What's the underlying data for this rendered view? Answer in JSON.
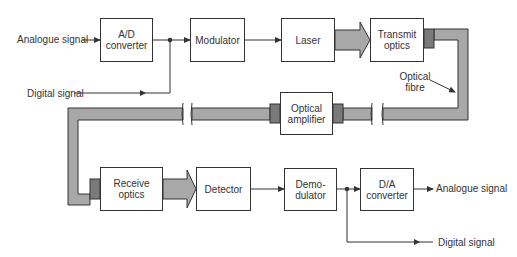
{
  "diagram": {
    "colors": {
      "line": "#333333",
      "fibre": "#a8a8a8",
      "connector": "#7a7a7a",
      "background": "#ffffff"
    },
    "transmitter": {
      "input_analogue": "Analogue signal",
      "input_digital": "Digital signal",
      "blocks": [
        {
          "id": "ad",
          "label": "A/D\nconverter"
        },
        {
          "id": "mod",
          "label": "Modulator"
        },
        {
          "id": "laser",
          "label": "Laser"
        },
        {
          "id": "tx",
          "label": "Transmit\noptics"
        }
      ]
    },
    "channel": {
      "fibre_label": "Optical\nfibre",
      "amplifier_label": "Optical\namplifier"
    },
    "receiver": {
      "blocks": [
        {
          "id": "rx",
          "label": "Receive\noptics"
        },
        {
          "id": "det",
          "label": "Detector"
        },
        {
          "id": "demod",
          "label": "Demo-\ndulator"
        },
        {
          "id": "da",
          "label": "D/A\nconverter"
        }
      ],
      "output_analogue": "Analogue signal",
      "output_digital": "Digital signal"
    }
  }
}
